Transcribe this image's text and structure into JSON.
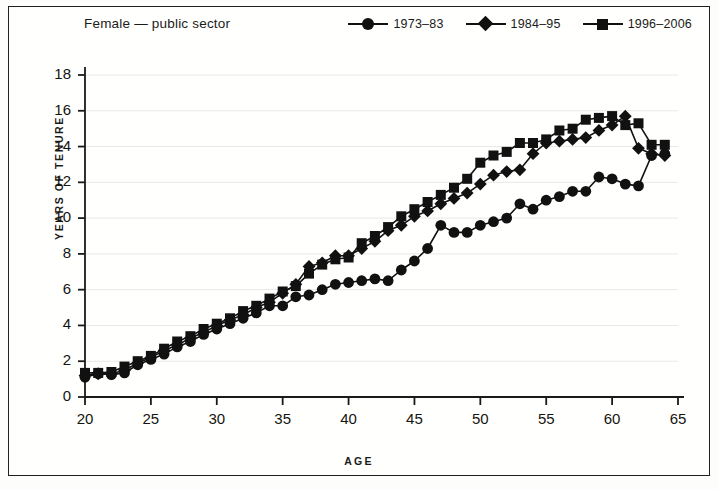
{
  "chart_data": {
    "type": "line",
    "title": "Female — public sector",
    "xlabel": "AGE",
    "ylabel": "YEARS OF TENURE",
    "xlim": [
      20,
      65
    ],
    "ylim": [
      0,
      18
    ],
    "xticks": [
      20,
      25,
      30,
      35,
      40,
      45,
      50,
      55,
      60,
      65
    ],
    "yticks": [
      0,
      2,
      4,
      6,
      8,
      10,
      12,
      14,
      16,
      18
    ],
    "grid": "horizontal-faint",
    "legend_position": "top-right",
    "markers": {
      "1973–83": "circle",
      "1984–95": "diamond",
      "1996–2006": "square"
    },
    "line_color": "#111111",
    "series": [
      {
        "name": "1973–83",
        "marker": "circle",
        "x": [
          20,
          21,
          22,
          23,
          24,
          25,
          26,
          27,
          28,
          29,
          30,
          31,
          32,
          33,
          34,
          35,
          36,
          37,
          38,
          39,
          40,
          41,
          42,
          43,
          44,
          45,
          46,
          47,
          48,
          49,
          50,
          51,
          52,
          53,
          54,
          55,
          56,
          57,
          58,
          59,
          60,
          61,
          62,
          63,
          64
        ],
        "values": [
          1.1,
          1.3,
          1.25,
          1.35,
          1.8,
          2.1,
          2.4,
          2.8,
          3.1,
          3.5,
          3.8,
          4.1,
          4.4,
          4.7,
          5.1,
          5.1,
          5.6,
          5.7,
          6.0,
          6.3,
          6.4,
          6.5,
          6.6,
          6.5,
          7.1,
          7.6,
          8.3,
          9.6,
          9.2,
          9.2,
          9.6,
          9.8,
          10.0,
          10.8,
          10.5,
          11.0,
          11.2,
          11.5,
          11.5,
          12.3,
          12.2,
          11.9,
          11.8,
          13.5,
          13.6
        ]
      },
      {
        "name": "1984–95",
        "marker": "diamond",
        "x": [
          20,
          21,
          22,
          23,
          24,
          25,
          26,
          27,
          28,
          29,
          30,
          31,
          32,
          33,
          34,
          35,
          36,
          37,
          38,
          39,
          40,
          41,
          42,
          43,
          44,
          45,
          46,
          47,
          48,
          49,
          50,
          51,
          52,
          53,
          54,
          55,
          56,
          57,
          58,
          59,
          60,
          61,
          62,
          63,
          64
        ],
        "values": [
          1.2,
          1.3,
          1.3,
          1.5,
          1.9,
          2.2,
          2.6,
          2.9,
          3.3,
          3.6,
          4.0,
          4.3,
          4.6,
          5.0,
          5.3,
          5.8,
          6.3,
          7.3,
          7.5,
          7.9,
          7.9,
          8.3,
          8.7,
          9.3,
          9.6,
          10.1,
          10.4,
          10.8,
          11.1,
          11.4,
          11.9,
          12.4,
          12.6,
          12.7,
          13.6,
          14.2,
          14.3,
          14.4,
          14.5,
          14.9,
          15.2,
          15.7,
          13.9,
          13.6,
          13.5
        ]
      },
      {
        "name": "1996–2006",
        "marker": "square",
        "x": [
          20,
          21,
          22,
          23,
          24,
          25,
          26,
          27,
          28,
          29,
          30,
          31,
          32,
          33,
          34,
          35,
          36,
          37,
          38,
          39,
          40,
          41,
          42,
          43,
          44,
          45,
          46,
          47,
          48,
          49,
          50,
          51,
          52,
          53,
          54,
          55,
          56,
          57,
          58,
          59,
          60,
          61,
          62,
          63,
          64
        ],
        "values": [
          1.35,
          1.35,
          1.4,
          1.7,
          2.0,
          2.3,
          2.7,
          3.1,
          3.4,
          3.8,
          4.1,
          4.4,
          4.8,
          5.1,
          5.5,
          5.9,
          6.2,
          6.9,
          7.4,
          7.7,
          7.8,
          8.6,
          9.0,
          9.5,
          10.1,
          10.5,
          10.9,
          11.3,
          11.7,
          12.2,
          13.1,
          13.5,
          13.7,
          14.2,
          14.2,
          14.4,
          14.9,
          15.0,
          15.5,
          15.6,
          15.7,
          15.2,
          15.3,
          14.1,
          14.1
        ]
      }
    ]
  },
  "legend": {
    "items": [
      {
        "label": "1973–83",
        "marker": "circle"
      },
      {
        "label": "1984–95",
        "marker": "diamond"
      },
      {
        "label": "1996–2006",
        "marker": "square"
      }
    ]
  }
}
